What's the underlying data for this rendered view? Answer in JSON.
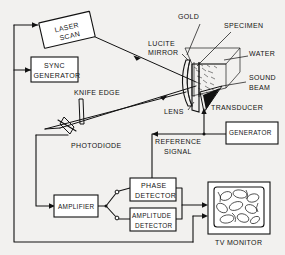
{
  "figure": {
    "background_color": "#f2f1ef",
    "ink_color": "#121212"
  },
  "blocks": [
    {
      "id": "laser-scan",
      "label_line1": "LASER",
      "label_line2": "SCAN"
    },
    {
      "id": "sync-generator",
      "label_line1": "SYNC",
      "label_line2": "GENERATOR"
    },
    {
      "id": "amplifier",
      "label_line1": "AMPLIFIER",
      "label_line2": ""
    },
    {
      "id": "phase-detector",
      "label_line1": "PHASE",
      "label_line2": "DETECTOR"
    },
    {
      "id": "amplitude-detector",
      "label_line1": "AMPLITUDE",
      "label_line2": "DETECTOR"
    },
    {
      "id": "generator",
      "label_line1": "GENERATOR",
      "label_line2": ""
    },
    {
      "id": "tv-monitor",
      "label_line1": "TV MONITOR",
      "label_line2": ""
    }
  ],
  "callouts": {
    "gold": "GOLD",
    "specimen": "SPECIMEN",
    "water": "WATER",
    "lucite_line1": "LUCITE",
    "lucite_line2": "MIRROR",
    "sound_line1": "SOUND",
    "sound_line2": "BEAM",
    "lens": "LENS",
    "transducer": "TRANSDUCER",
    "knife_edge": "KNIFE EDGE",
    "photodiode": "PHOTODIODE",
    "reference_line1": "REFERENCE",
    "reference_line2": "SIGNAL",
    "tv_monitor": "TV MONITOR"
  },
  "box_labels": {
    "laser_l1": "LASER",
    "laser_l2": "SCAN",
    "sync_l1": "SYNC",
    "sync_l2": "GENERATOR",
    "amplifier": "AMPLIFIER",
    "phase_l1": "PHASE",
    "phase_l2": "DETECTOR",
    "amplitude_l1": "AMPLITUDE",
    "amplitude_l2": "DETECTOR",
    "generator": "GENERATOR"
  }
}
